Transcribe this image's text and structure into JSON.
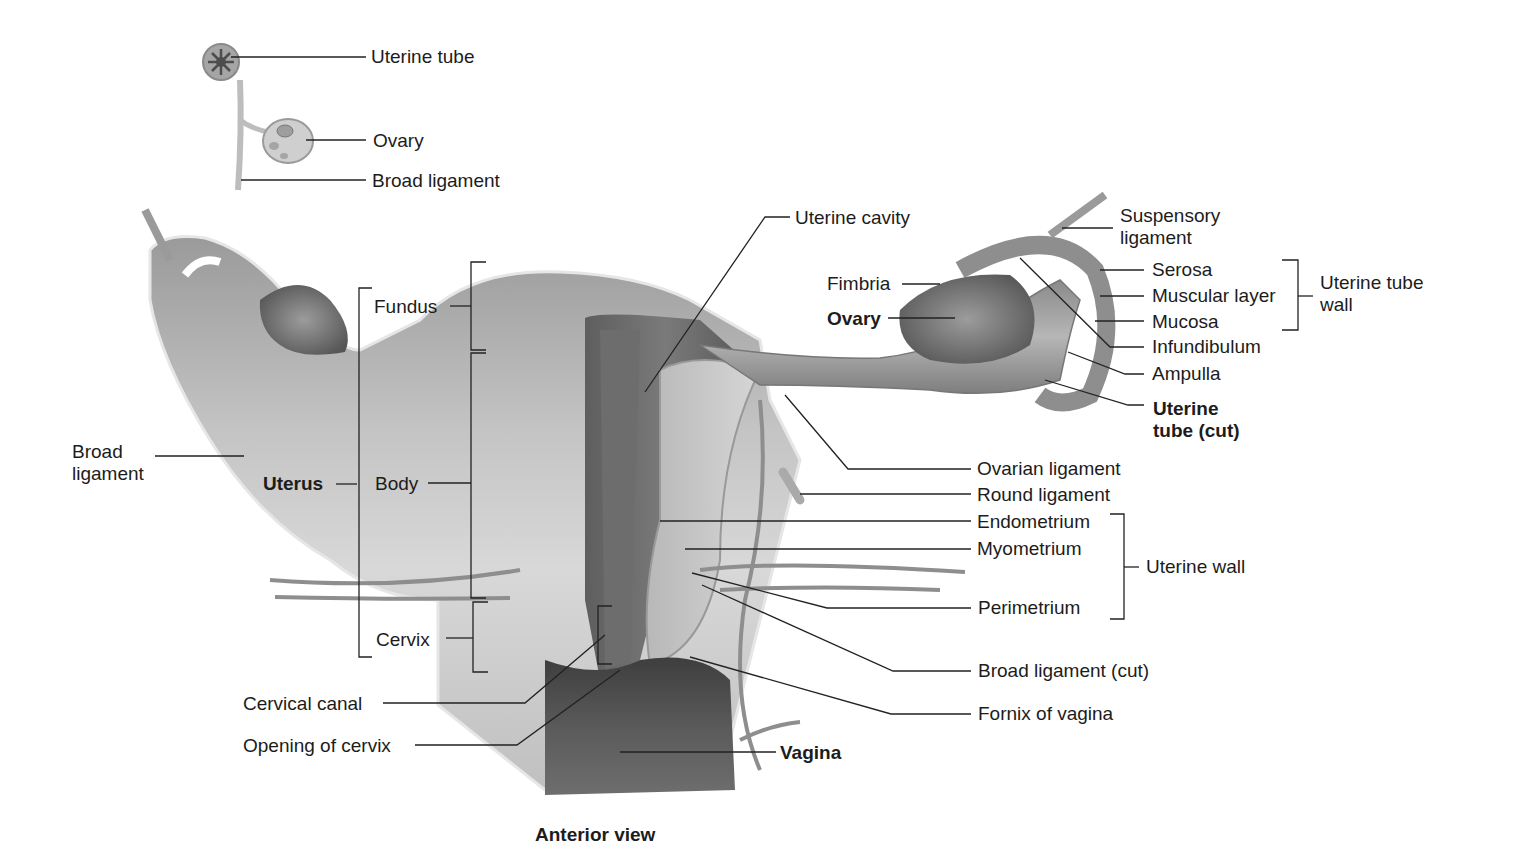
{
  "caption": "Anterior view",
  "inset": {
    "labels": {
      "uterine_tube": "Uterine tube",
      "ovary": "Ovary",
      "broad_ligament": "Broad ligament"
    }
  },
  "left_labels": {
    "broad_ligament_line1": "Broad",
    "broad_ligament_line2": "ligament",
    "uterus": "Uterus",
    "fundus": "Fundus",
    "body": "Body",
    "cervix": "Cervix",
    "cervical_canal": "Cervical canal",
    "opening_of_cervix": "Opening of cervix"
  },
  "center_labels": {
    "uterine_cavity": "Uterine cavity",
    "fimbria": "Fimbria",
    "ovary": "Ovary",
    "vagina": "Vagina"
  },
  "right_labels": {
    "suspensory_ligament_line1": "Suspensory",
    "suspensory_ligament_line2": "ligament",
    "serosa": "Serosa",
    "muscular_layer": "Muscular layer",
    "mucosa": "Mucosa",
    "uterine_tube_wall_line1": "Uterine tube",
    "uterine_tube_wall_line2": "wall",
    "infundibulum": "Infundibulum",
    "ampulla": "Ampulla",
    "uterine_tube_cut_line1": "Uterine",
    "uterine_tube_cut_line2": "tube (cut)",
    "ovarian_ligament": "Ovarian ligament",
    "round_ligament": "Round ligament",
    "endometrium": "Endometrium",
    "myometrium": "Myometrium",
    "uterine_wall": "Uterine wall",
    "perimetrium": "Perimetrium",
    "broad_ligament_cut": "Broad ligament (cut)",
    "fornix_of_vagina": "Fornix of vagina"
  }
}
